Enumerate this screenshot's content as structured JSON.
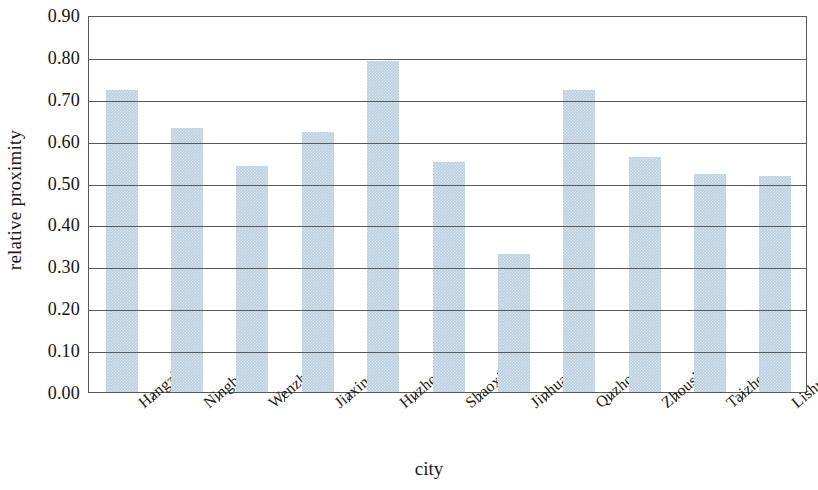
{
  "chart_data": {
    "type": "bar",
    "title": "",
    "xlabel": "city",
    "ylabel": "relative proximity",
    "categories": [
      "Hangzhou",
      "Ningbo",
      "Wenzhou",
      "Jiaxing",
      "Huzhou",
      "Shaoxing",
      "Jinhua",
      "Quzhou",
      "Zhoushan",
      "Taizhou",
      "Lishui"
    ],
    "values": [
      0.72,
      0.63,
      0.54,
      0.62,
      0.79,
      0.55,
      0.33,
      0.72,
      0.56,
      0.52,
      0.515
    ],
    "ylim": [
      0.0,
      0.9
    ],
    "ytick_labels": [
      "0.90",
      "0.80",
      "0.70",
      "0.60",
      "0.50",
      "0.40",
      "0.30",
      "0.20",
      "0.10",
      "0.00"
    ],
    "ytick_values": [
      0.9,
      0.8,
      0.7,
      0.6,
      0.5,
      0.4,
      0.3,
      0.2,
      0.1,
      0.0
    ],
    "grid": true,
    "legend": null,
    "legend_position": "none",
    "bar_color": "#b9cee1",
    "axis_color": "#59595c"
  }
}
